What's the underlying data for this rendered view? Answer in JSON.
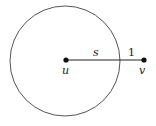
{
  "diagram": {
    "circle": {
      "cx": 65,
      "cy": 61,
      "r": 55,
      "stroke": "#555555"
    },
    "points": [
      {
        "id": "u",
        "label": "u",
        "x": 66,
        "y": 60
      },
      {
        "id": "v",
        "label": "v",
        "x": 144,
        "y": 60
      }
    ],
    "segment_labels": {
      "s": "s",
      "one": "1"
    },
    "line_color": "#222222"
  }
}
